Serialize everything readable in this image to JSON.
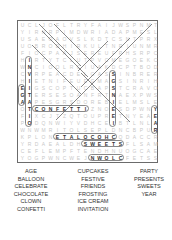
{
  "puzzle": {
    "grid": [
      "UCLJOFLTRYFAIJWSPNMT",
      "YIRNRPIMDWRIADAPMESL",
      "USAEOAOVSLKDTCSNTPRX",
      "UOBRODHIRKULTNRIUNMR",
      "FIOCPAAJSEREUFPHSRPC",
      "HIRTYTCLUTPVCMEGOEKC",
      "WNCIOOLRCIUAKDCPTBOD",
      "CVRPEACDELGASSINBRER",
      "HIETNIFEUEGMAGSINRIH",
      "EIGSCOPTUCBAPSTCRAVO",
      "GTERSESOANFRTNAEXPWS",
      "AAPESGRSDOREBIELMSLE",
      "OTCONFETTIZNOESDPWNY",
      "FIXCJTZQTOUPRETNYEAE",
      "PODQNWIYVDHCEIBTLNLA",
      "WNWMRITOLSEPLDNCBPUR",
      "KPLONETALOCOHCQDACCR",
      "YRDAEALDHSWEETSFLSAM",
      "CEFLEMPFTENDHNUOGCAE",
      "YOGPWNCWEJNWOLCFETSS"
    ],
    "found_words_highlighted": [
      "CONFETTI",
      "ETALOCOHC",
      "SWEETS",
      "NWOLC",
      "INVITATION",
      "EGA",
      "STNESERP",
      "YEAR"
    ]
  },
  "word_list": {
    "column_1": [
      "AGE",
      "BALLOON",
      "CELEBRATE",
      "CHOCOLATE",
      "CLOWN",
      "CONFETTI"
    ],
    "column_2": [
      "CUPCAKES",
      "FESTIVE",
      "FRIENDS",
      "FROSTING",
      "ICE CREAM",
      "INVITATION"
    ],
    "column_3": [
      "PARTY",
      "PRESENTS",
      "SWEETS",
      "YEAR"
    ]
  },
  "colors": {
    "found_letter": "#333333",
    "filler_letter": "#c8c8c8",
    "outline": "#555555",
    "border": "#6b6b6b"
  }
}
